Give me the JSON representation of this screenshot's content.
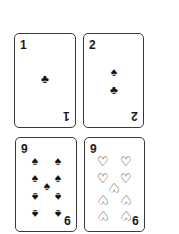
{
  "cards": [
    {
      "rank": "1",
      "suit": "clubs",
      "pips": [
        {
          "glyph": "♣",
          "icon": "club-icon"
        }
      ]
    },
    {
      "rank": "2",
      "suit": "spades",
      "pips": [
        {
          "glyph": "♠",
          "icon": "spade-icon"
        },
        {
          "glyph": "♣",
          "icon": "club-icon"
        }
      ]
    },
    {
      "rank": "9",
      "suit": "spades",
      "pips": [
        {
          "glyph": "♠",
          "icon": "spade-icon"
        },
        {
          "glyph": "♠",
          "icon": "spade-icon"
        },
        {
          "glyph": "♠",
          "icon": "spade-icon"
        },
        {
          "glyph": "♠",
          "icon": "spade-icon"
        },
        {
          "glyph": "♠",
          "icon": "spade-icon"
        },
        {
          "glyph": "♠",
          "icon": "spade-icon"
        },
        {
          "glyph": "♠",
          "icon": "spade-icon"
        },
        {
          "glyph": "♠",
          "icon": "spade-icon"
        },
        {
          "glyph": "♠",
          "icon": "spade-icon"
        }
      ]
    },
    {
      "rank": "9",
      "suit": "hearts",
      "pips": [
        {
          "glyph": "♡",
          "icon": "heart-outline-icon"
        },
        {
          "glyph": "♡",
          "icon": "heart-outline-icon"
        },
        {
          "glyph": "♡",
          "icon": "heart-outline-icon"
        },
        {
          "glyph": "♡",
          "icon": "heart-outline-icon"
        },
        {
          "glyph": "♡",
          "icon": "heart-outline-icon"
        },
        {
          "glyph": "♡",
          "icon": "heart-outline-icon"
        },
        {
          "glyph": "♡",
          "icon": "heart-outline-icon"
        },
        {
          "glyph": "♡",
          "icon": "heart-outline-icon"
        },
        {
          "glyph": "♡",
          "icon": "heart-outline-icon"
        }
      ]
    }
  ],
  "colors": {
    "border": "#3a3a3a",
    "ink": "#111111",
    "background": "#ffffff"
  }
}
